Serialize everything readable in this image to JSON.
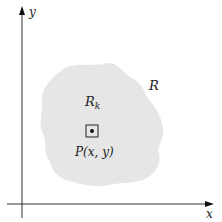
{
  "diagram": {
    "axes": {
      "x_label": "x",
      "y_label": "y"
    },
    "region": {
      "label": "R",
      "fill_color": "#e6e6e6"
    },
    "subregion": {
      "label_main": "R",
      "label_sub": "k"
    },
    "point": {
      "label": "P(x, y)"
    },
    "colors": {
      "axis": "#333333",
      "region": "#e6e6e6",
      "box": "#222222"
    }
  }
}
